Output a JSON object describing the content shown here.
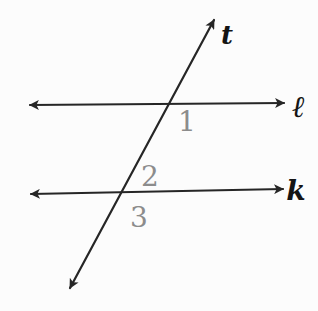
{
  "diagram": {
    "colors": {
      "background": "#fcfcfc",
      "line": "#262626",
      "line_label": "#141414",
      "angle_number": "#8c8c8c"
    },
    "lines": {
      "transversal": {
        "label": "t"
      },
      "top_parallel": {
        "label": "ℓ"
      },
      "bottom_parallel": {
        "label": "k"
      }
    },
    "angles": {
      "angle1": {
        "label": "1"
      },
      "angle2": {
        "label": "2"
      },
      "angle3": {
        "label": "3"
      }
    }
  }
}
